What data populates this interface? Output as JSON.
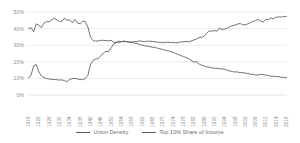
{
  "chart_data": {
    "type": "line",
    "title": "",
    "subtitle": "",
    "xlabel": "",
    "ylabel": "",
    "ylim": [
      0,
      50
    ],
    "ytick_labels": [
      "0%",
      "10%",
      "20%",
      "30%",
      "40%",
      "50%"
    ],
    "ytick_values": [
      0,
      10,
      20,
      30,
      40,
      50
    ],
    "grid": true,
    "legend_position": "bottom",
    "xlim": [
      1918,
      2018
    ],
    "x": [
      1918,
      1919,
      1920,
      1921,
      1922,
      1923,
      1924,
      1925,
      1926,
      1927,
      1928,
      1929,
      1930,
      1931,
      1932,
      1933,
      1934,
      1935,
      1936,
      1937,
      1938,
      1939,
      1940,
      1941,
      1942,
      1943,
      1944,
      1945,
      1946,
      1947,
      1948,
      1949,
      1950,
      1951,
      1952,
      1953,
      1954,
      1955,
      1956,
      1957,
      1958,
      1959,
      1960,
      1961,
      1962,
      1963,
      1964,
      1965,
      1966,
      1967,
      1968,
      1969,
      1970,
      1971,
      1972,
      1973,
      1974,
      1975,
      1976,
      1977,
      1978,
      1979,
      1980,
      1981,
      1982,
      1983,
      1984,
      1985,
      1986,
      1987,
      1988,
      1989,
      1990,
      1991,
      1992,
      1993,
      1994,
      1995,
      1996,
      1997,
      1998,
      1999,
      2000,
      2001,
      2002,
      2003,
      2004,
      2005,
      2006,
      2007,
      2008,
      2009,
      2010,
      2011,
      2012,
      2013,
      2014,
      2015,
      2016,
      2017,
      2018
    ],
    "xtick_labels": [
      "1918",
      "1922",
      "1926",
      "1930",
      "1934",
      "1938",
      "1942",
      "1946",
      "1950",
      "1954",
      "1958",
      "1962",
      "1966",
      "1970",
      "1974",
      "1978",
      "1982",
      "1986",
      "1990",
      "1994",
      "1998",
      "2002",
      "2006",
      "2010",
      "2014",
      "2018"
    ],
    "xtick_values": [
      1918,
      1922,
      1926,
      1930,
      1934,
      1938,
      1942,
      1946,
      1950,
      1954,
      1958,
      1962,
      1966,
      1970,
      1974,
      1978,
      1982,
      1986,
      1990,
      1994,
      1998,
      2002,
      2006,
      2010,
      2014,
      2018
    ],
    "series": [
      {
        "name": "Union Density",
        "color": "#5a5a5a",
        "values": [
          10.2,
          12.0,
          17.6,
          18.3,
          14.0,
          11.4,
          10.5,
          9.9,
          9.6,
          9.4,
          9.3,
          9.2,
          9.0,
          9.1,
          8.6,
          8.1,
          9.5,
          9.8,
          10.0,
          9.6,
          9.4,
          9.2,
          9.9,
          11.8,
          18.1,
          20.9,
          21.6,
          22.0,
          23.5,
          25.3,
          26.3,
          26.0,
          28.4,
          30.7,
          31.6,
          32.5,
          32.0,
          32.5,
          32.2,
          31.9,
          31.8,
          31.3,
          31.0,
          30.5,
          30.1,
          29.6,
          29.4,
          29.2,
          28.8,
          28.6,
          28.2,
          27.9,
          27.4,
          27.0,
          26.6,
          26.2,
          25.7,
          25.0,
          24.4,
          23.8,
          23.2,
          22.6,
          22.0,
          20.9,
          19.8,
          20.1,
          18.8,
          18.0,
          17.5,
          17.0,
          16.8,
          16.4,
          16.1,
          16.1,
          15.8,
          15.8,
          15.5,
          14.9,
          14.5,
          14.1,
          13.9,
          13.9,
          13.5,
          13.4,
          13.3,
          12.9,
          12.5,
          12.5,
          12.0,
          12.1,
          12.4,
          12.3,
          11.9,
          11.8,
          11.3,
          11.3,
          11.1,
          11.1,
          10.7,
          10.7,
          10.5
        ]
      },
      {
        "name": "Top 10% Share of Income",
        "color": "#5a5a5a",
        "values": [
          39.9,
          40.6,
          38.1,
          42.9,
          42.0,
          40.6,
          43.3,
          44.2,
          44.1,
          45.3,
          46.2,
          45.2,
          44.3,
          44.4,
          46.3,
          45.0,
          45.2,
          43.4,
          45.5,
          43.3,
          43.0,
          44.5,
          44.4,
          41.0,
          35.0,
          32.8,
          32.4,
          32.6,
          33.0,
          32.9,
          32.8,
          32.6,
          33.0,
          31.8,
          31.7,
          31.5,
          32.2,
          32.2,
          32.1,
          31.8,
          31.9,
          32.2,
          32.1,
          32.7,
          32.3,
          32.2,
          32.4,
          32.4,
          32.3,
          32.1,
          31.8,
          31.8,
          31.5,
          31.7,
          31.8,
          31.6,
          31.7,
          31.4,
          31.6,
          32.0,
          32.0,
          32.3,
          32.1,
          32.5,
          33.0,
          33.7,
          34.5,
          34.8,
          35.3,
          37.0,
          38.6,
          38.5,
          38.8,
          38.4,
          40.3,
          39.5,
          39.6,
          40.2,
          41.2,
          41.7,
          42.1,
          42.7,
          43.1,
          42.2,
          42.4,
          42.8,
          43.6,
          44.3,
          44.9,
          45.5,
          44.5,
          44.0,
          45.5,
          45.4,
          46.5,
          45.9,
          46.9,
          47.0,
          47.0,
          47.2,
          47.4
        ]
      }
    ]
  },
  "legend": {
    "items": [
      {
        "label": "Union Density",
        "color": "#5a5a5a"
      },
      {
        "label": "Top 10% Share of Income",
        "color": "#5a5a5a"
      }
    ]
  }
}
